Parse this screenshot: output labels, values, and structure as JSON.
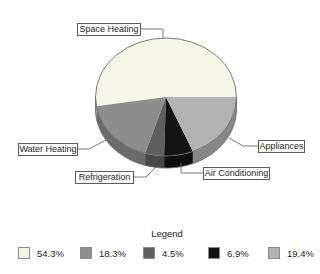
{
  "chart_data": {
    "type": "pie",
    "style": "3d",
    "legend_title": "Legend",
    "legend_position": "bottom",
    "start_angle_deg": 0,
    "direction": "counterclockwise",
    "slices": [
      {
        "label": "Space Heating",
        "value": 54.3,
        "display": "54.3%",
        "color": "#f6f6e6"
      },
      {
        "label": "Water Heating",
        "value": 18.3,
        "display": "18.3%",
        "color": "#8d8d8d"
      },
      {
        "label": "Refrigeration",
        "value": 4.5,
        "display": "4.5%",
        "color": "#5f5f5f"
      },
      {
        "label": "Air Conditioning",
        "value": 6.9,
        "display": "6.9%",
        "color": "#141414"
      },
      {
        "label": "Appliances",
        "value": 19.4,
        "display": "19.4%",
        "color": "#b2b2b2"
      }
    ],
    "outline_color": "#6b6b6b"
  }
}
